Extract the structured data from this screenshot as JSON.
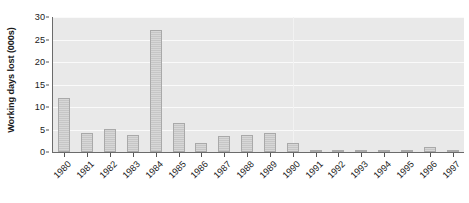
{
  "chart_data": {
    "type": "bar",
    "title": "",
    "subtitle": "",
    "xlabel": "",
    "ylabel": "Working days lost (000s)",
    "categories": [
      "1980",
      "1981",
      "1982",
      "1983",
      "1984",
      "1985",
      "1986",
      "1987",
      "1988",
      "1989",
      "1990",
      "1991",
      "1992",
      "1993",
      "1994",
      "1995",
      "1996",
      "1997"
    ],
    "values": [
      11.9,
      4.2,
      5.2,
      3.7,
      27.1,
      6.4,
      2.0,
      3.5,
      3.7,
      4.2,
      2.0,
      0.4,
      0.4,
      0.4,
      0.2,
      0.3,
      1.2,
      0.2
    ],
    "series": [
      {
        "name": "Working days lost",
        "values": [
          11.9,
          4.2,
          5.2,
          3.7,
          27.1,
          6.4,
          2.0,
          3.5,
          3.7,
          4.2,
          2.0,
          0.4,
          0.4,
          0.4,
          0.2,
          0.3,
          1.2,
          0.2
        ]
      }
    ],
    "ylim": [
      0,
      30
    ],
    "yticks": [
      0,
      5,
      10,
      15,
      20,
      25,
      30
    ],
    "ytick_labels": [
      "0",
      "5",
      "10",
      "15",
      "20",
      "25",
      "30"
    ],
    "grid": "horizontal",
    "legend": "none",
    "bar_color": "#c6c6c6",
    "bar_edge_color": "#a9a9a9",
    "plot_background": "#e9e9e9",
    "gridline_color": "#fafafa",
    "axis_color": "#6b6b6b",
    "text_color": "#1a1a1a",
    "xtick_rotation": -45
  }
}
